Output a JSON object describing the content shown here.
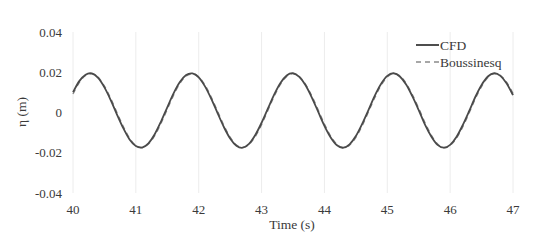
{
  "chart_data": {
    "type": "line",
    "title": "",
    "xlabel": "Time (s)",
    "ylabel": "η (m)",
    "xlim": [
      40,
      47
    ],
    "ylim": [
      -0.04,
      0.04
    ],
    "xticks": [
      "40",
      "41",
      "42",
      "43",
      "44",
      "45",
      "46",
      "47"
    ],
    "yticks": [
      "0.04",
      "0.02",
      "0",
      "-0.02",
      "-0.04"
    ],
    "ytick_values": [
      0.04,
      0.02,
      0,
      -0.02,
      -0.04
    ],
    "xtick_values": [
      40,
      41,
      42,
      43,
      44,
      45,
      46,
      47
    ],
    "grid": "vertical faint",
    "legend_position": "upper right",
    "x": [
      40.0,
      40.1,
      40.2,
      40.3,
      40.4,
      40.5,
      40.6,
      40.7,
      40.8,
      40.9,
      41.0,
      41.1,
      41.2,
      41.3,
      41.4,
      41.5,
      41.6,
      41.7,
      41.8,
      41.9,
      42.0,
      42.1,
      42.2,
      42.3,
      42.4,
      42.5,
      42.6,
      42.7,
      42.8,
      42.9,
      43.0,
      43.1,
      43.2,
      43.3,
      43.4,
      43.5,
      43.6,
      43.7,
      43.8,
      43.9,
      44.0,
      44.1,
      44.2,
      44.3,
      44.4,
      44.5,
      44.6,
      44.7,
      44.8,
      44.9,
      45.0,
      45.1,
      45.2,
      45.3,
      45.4,
      45.5,
      45.6,
      45.7,
      45.8,
      45.9,
      46.0,
      46.1,
      46.2,
      46.3,
      46.4,
      46.5,
      46.6,
      46.7,
      46.8,
      46.9,
      47.0
    ],
    "series": [
      {
        "name": "CFD",
        "style": "solid",
        "color": "#4a4a4a",
        "values": [
          0.0101,
          0.0156,
          0.0188,
          0.0194,
          0.0172,
          0.0125,
          0.0062,
          -0.001,
          -0.0078,
          -0.0134,
          -0.0167,
          -0.0174,
          -0.0153,
          -0.0108,
          -0.0045,
          0.0026,
          0.0095,
          0.0151,
          0.0186,
          0.0194,
          0.0175,
          0.013,
          0.0068,
          -0.0003,
          -0.0072,
          -0.0129,
          -0.0165,
          -0.0175,
          -0.0156,
          -0.0112,
          -0.0051,
          0.0019,
          0.0089,
          0.0147,
          0.0184,
          0.0195,
          0.0177,
          0.0135,
          0.0074,
          0.0004,
          -0.0066,
          -0.0124,
          -0.0163,
          -0.0175,
          -0.0158,
          -0.0117,
          -0.0057,
          0.0012,
          0.0083,
          0.0142,
          0.0182,
          0.0195,
          0.0179,
          0.0139,
          0.008,
          0.0012,
          -0.006,
          -0.0119,
          -0.0161,
          -0.0175,
          -0.0161,
          -0.0122,
          -0.0063,
          0.0005,
          0.0077,
          0.0137,
          0.0179,
          0.0195,
          0.0182,
          0.0144,
          0.0086
        ]
      },
      {
        "name": "Boussinesq",
        "style": "dashed",
        "color": "#8a8a8a",
        "values": [
          0.0092,
          0.0149,
          0.0184,
          0.0192,
          0.0175,
          0.0131,
          0.007,
          -0.0001,
          -0.007,
          -0.0128,
          -0.0164,
          -0.0174,
          -0.0157,
          -0.0115,
          -0.0054,
          0.0016,
          0.0086,
          0.0144,
          0.0181,
          0.0192,
          0.0177,
          0.0136,
          0.0076,
          0.0006,
          -0.0064,
          -0.0123,
          -0.0162,
          -0.0174,
          -0.0159,
          -0.0119,
          -0.006,
          0.001,
          0.008,
          0.014,
          0.0179,
          0.0193,
          0.0179,
          0.014,
          0.0082,
          0.0013,
          -0.0057,
          -0.0117,
          -0.0159,
          -0.0175,
          -0.0162,
          -0.0124,
          -0.0066,
          0.0003,
          0.0073,
          0.0134,
          0.0176,
          0.0193,
          0.0182,
          0.0145,
          0.0088,
          0.0021,
          -0.0051,
          -0.0112,
          -0.0157,
          -0.0175,
          -0.0164,
          -0.0128,
          -0.0072,
          -0.0004,
          0.0068,
          0.0129,
          0.0174,
          0.0193,
          0.0184,
          0.0149,
          0.0095
        ]
      }
    ]
  },
  "legend": {
    "items": [
      {
        "label": "CFD",
        "style": "solid"
      },
      {
        "label": "Boussinesq",
        "style": "dashed"
      }
    ]
  },
  "axes": {
    "xlabel": "Time (s)",
    "ylabel": "η (m)"
  }
}
